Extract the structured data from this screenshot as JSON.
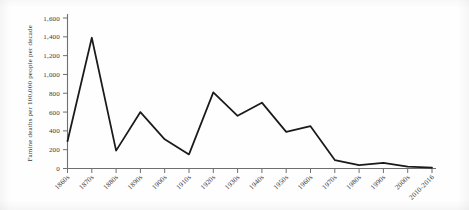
{
  "chart_data": {
    "type": "line",
    "title": "",
    "xlabel": "",
    "ylabel": "Famine deaths per 100,000 people per decade",
    "categories": [
      "1860s",
      "1870s",
      "1880s",
      "1890s",
      "1900s",
      "1910s",
      "1920s",
      "1930s",
      "1940s",
      "1950s",
      "1960s",
      "1970s",
      "1980s",
      "1990s",
      "2000s",
      "2010-2016"
    ],
    "values": [
      290,
      1390,
      190,
      600,
      310,
      150,
      810,
      560,
      700,
      390,
      450,
      90,
      35,
      60,
      20,
      10
    ],
    "series": [
      {
        "name": "Famine deaths per 100,000 people per decade",
        "values": [
          290,
          1390,
          190,
          600,
          310,
          150,
          810,
          560,
          700,
          390,
          450,
          90,
          35,
          60,
          20,
          10
        ]
      }
    ],
    "ylim": [
      0,
      1600
    ],
    "ytick_values": [
      0,
      200,
      400,
      600,
      800,
      1000,
      1200,
      1400,
      1600
    ],
    "ytick_labels": [
      "0",
      "200",
      "400",
      "600",
      "800",
      "1,000",
      "1,200",
      "1,400",
      "1,600"
    ],
    "grid": false,
    "legend": false,
    "legend_position": "none",
    "line_color": "#1a1a1a",
    "axis_color": "#6f6f6f",
    "background_color": "#fefefe"
  }
}
